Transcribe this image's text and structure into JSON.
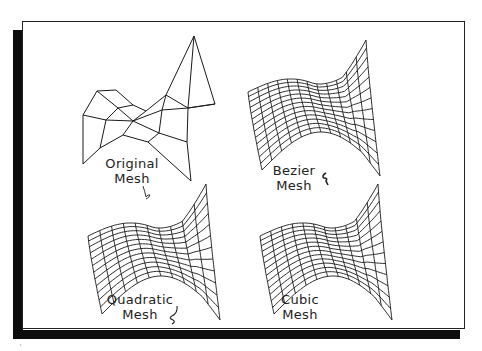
{
  "figure": {
    "panels": [
      {
        "id": "original",
        "label_line1": "Original",
        "label_line2": "Mesh",
        "type": "control-mesh"
      },
      {
        "id": "bezier",
        "label_line1": "Bezier",
        "label_line2": "Mesh",
        "type": "saddle-surface"
      },
      {
        "id": "quadratic",
        "label_line1": "Quadratic",
        "label_line2": "Mesh",
        "type": "saddle-surface"
      },
      {
        "id": "cubic",
        "label_line1": "Cubic",
        "label_line2": "Mesh",
        "type": "saddle-surface"
      }
    ],
    "colors": {
      "line": "#1a1a1a",
      "shadow": "#0d0d0d",
      "background": "#ffffff"
    },
    "icons": {
      "original_mark": "hand-drawn-squiggle-icon",
      "bezier_mark": "hand-drawn-squiggle-icon",
      "quadratic_mark": "hand-drawn-squiggle-icon"
    }
  }
}
